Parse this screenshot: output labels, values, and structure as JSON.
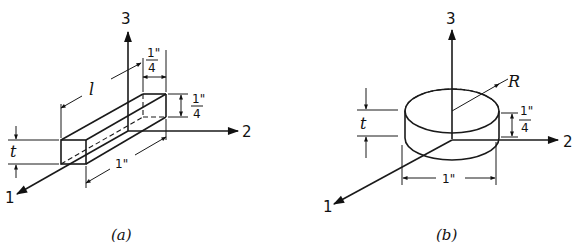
{
  "figure": {
    "panel_a": {
      "caption": "(a)",
      "shape": "rectangular bar",
      "axes": {
        "axis_1": "1",
        "axis_2": "2",
        "axis_3": "3"
      },
      "dimensions": {
        "length_label": "l",
        "thickness_label": "t",
        "width_label": "1\"",
        "top_width_num": "1\"",
        "top_width_den": "4",
        "height_num": "1\"",
        "height_den": "4"
      }
    },
    "panel_b": {
      "caption": "(b)",
      "shape": "circular disk",
      "axes": {
        "axis_1": "1",
        "axis_2": "2",
        "axis_3": "3"
      },
      "dimensions": {
        "radius_label": "R",
        "thickness_label": "t",
        "diameter_label": "1\"",
        "height_num": "1\"",
        "height_den": "4"
      }
    }
  }
}
